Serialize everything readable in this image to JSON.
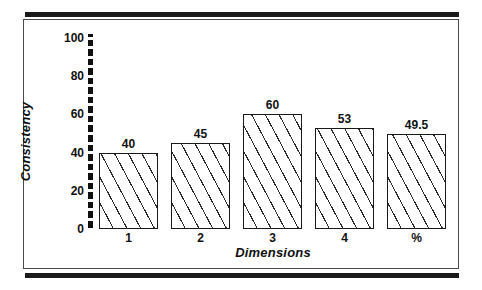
{
  "figure": {
    "frame_color": "#4a4a4a",
    "rule_color": "#1a1a1a",
    "background": "#ffffff"
  },
  "chart_data": {
    "type": "bar",
    "title": "",
    "subtitle": "",
    "xlabel": "Dimensions",
    "ylabel": "Consistency",
    "categories": [
      "1",
      "2",
      "3",
      "4",
      "%"
    ],
    "values": [
      40,
      45,
      60,
      53,
      49.5
    ],
    "value_labels": [
      "40",
      "45",
      "60",
      "53",
      "49.5"
    ],
    "ylim": [
      0,
      100
    ],
    "ytick_labels": [
      "0",
      "20",
      "40",
      "60",
      "80",
      "100"
    ],
    "ytick_values": [
      0,
      20,
      40,
      60,
      80,
      100
    ],
    "grid": false,
    "legend": null,
    "bar_fill": "hatched-diagonal",
    "bar_edge_color": "#1a1a1a",
    "axis_style": "thick-dashed-vertical"
  }
}
